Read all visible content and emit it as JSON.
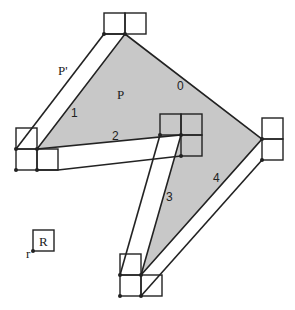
{
  "figure": {
    "labels": {
      "polygon": "P",
      "offset_polygon": "P'",
      "robot": "R",
      "reference_point": "r",
      "edge_0": "0",
      "edge_1": "1",
      "edge_2": "2",
      "edge_3": "3",
      "edge_4": "4"
    },
    "colors": {
      "polygon_fill": "#c8c8c8",
      "stroke": "#222222",
      "background": "#ffffff"
    },
    "caption_cropped": "…"
  }
}
